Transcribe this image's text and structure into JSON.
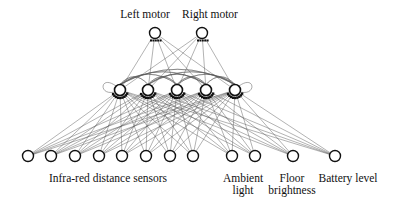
{
  "diagram": {
    "colors": {
      "node_stroke": "#111111",
      "edge": "#555555",
      "background": "#ffffff"
    },
    "output_layer": {
      "nodes": [
        {
          "id": "left-motor",
          "x": 155,
          "y": 33,
          "label": "Left motor",
          "label_x": 145,
          "label_y": 8
        },
        {
          "id": "right-motor",
          "x": 202,
          "y": 33,
          "label": "Right motor",
          "label_x": 210,
          "label_y": 8
        }
      ]
    },
    "hidden_layer": {
      "recurrent": true,
      "nodes": [
        {
          "id": "h1",
          "x": 120,
          "y": 90
        },
        {
          "id": "h2",
          "x": 148,
          "y": 90
        },
        {
          "id": "h3",
          "x": 177,
          "y": 90
        },
        {
          "id": "h4",
          "x": 206,
          "y": 90
        },
        {
          "id": "h5",
          "x": 235,
          "y": 90
        }
      ]
    },
    "input_layer": {
      "nodes": [
        {
          "id": "ir1",
          "x": 28,
          "y": 156
        },
        {
          "id": "ir2",
          "x": 51,
          "y": 156
        },
        {
          "id": "ir3",
          "x": 75,
          "y": 156
        },
        {
          "id": "ir4",
          "x": 99,
          "y": 156
        },
        {
          "id": "ir5",
          "x": 122,
          "y": 156
        },
        {
          "id": "ir6",
          "x": 146,
          "y": 156
        },
        {
          "id": "ir7",
          "x": 170,
          "y": 156
        },
        {
          "id": "ir8",
          "x": 193,
          "y": 156
        },
        {
          "id": "amb1",
          "x": 232,
          "y": 156
        },
        {
          "id": "amb2",
          "x": 255,
          "y": 156
        },
        {
          "id": "floor",
          "x": 293,
          "y": 156
        },
        {
          "id": "battery",
          "x": 335,
          "y": 156
        }
      ],
      "group_labels": [
        {
          "id": "ir",
          "text": "Infra-red distance sensors",
          "x": 108,
          "y": 172
        },
        {
          "id": "ambient",
          "text": "Ambient\nlight",
          "x": 243,
          "y": 172
        },
        {
          "id": "floor",
          "text": "Floor\nbrightness",
          "x": 292,
          "y": 172
        },
        {
          "id": "battery",
          "text": "Battery level",
          "x": 348,
          "y": 172
        }
      ]
    }
  }
}
